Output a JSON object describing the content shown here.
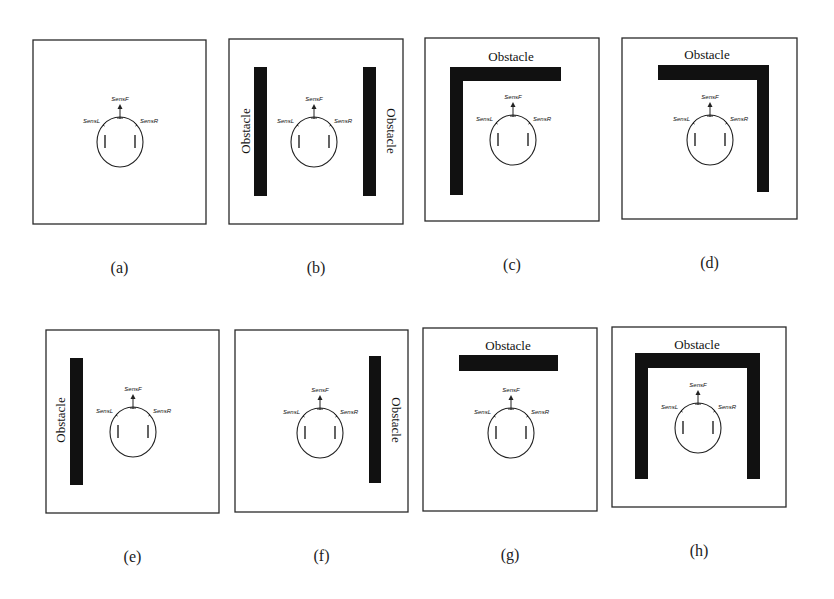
{
  "figure": {
    "obstacle_label": "Obstacle",
    "sensors": {
      "left": "SensL",
      "front": "SensF",
      "right": "SensR"
    },
    "colors": {
      "obstacle": "#111111",
      "line": "#222222",
      "background": "#ffffff"
    },
    "panels": [
      {
        "id": "a",
        "caption": "(a)",
        "description": "No obstacle",
        "box": [
          33,
          40,
          173,
          184
        ],
        "robot": [
          120,
          135
        ],
        "bars": [],
        "labels": []
      },
      {
        "id": "b",
        "caption": "(b)",
        "description": "Obstacles left and right",
        "box": [
          229,
          39,
          174,
          185
        ],
        "robot": [
          314,
          135
        ],
        "bars": [
          [
            254,
            67,
            13,
            129
          ],
          [
            363,
            67,
            13,
            129
          ]
        ],
        "labels": [
          {
            "x": 247,
            "y": 131,
            "rot": -90
          },
          {
            "x": 390,
            "y": 131,
            "rot": 90
          }
        ]
      },
      {
        "id": "c",
        "caption": "(c)",
        "description": "Obstacle front and left (corner)",
        "box": [
          425,
          38,
          174,
          183
        ],
        "robot": [
          513,
          133
        ],
        "bars": [
          [
            450,
            67,
            111,
            14
          ],
          [
            450,
            67,
            13,
            128
          ]
        ],
        "labels": [
          {
            "x": 511,
            "y": 58,
            "rot": 0
          }
        ]
      },
      {
        "id": "d",
        "caption": "(d)",
        "description": "Obstacle front and right (corner)",
        "box": [
          622,
          38,
          175,
          181
        ],
        "robot": [
          710,
          133
        ],
        "bars": [
          [
            658,
            65,
            111,
            15
          ],
          [
            757,
            65,
            12,
            127
          ]
        ],
        "labels": [
          {
            "x": 707,
            "y": 56,
            "rot": 0
          }
        ]
      },
      {
        "id": "e",
        "caption": "(e)",
        "description": "Obstacle left",
        "box": [
          46,
          330,
          173,
          183
        ],
        "robot": [
          133,
          425
        ],
        "bars": [
          [
            70,
            358,
            13,
            127
          ]
        ],
        "labels": [
          {
            "x": 62,
            "y": 420,
            "rot": -90
          }
        ]
      },
      {
        "id": "f",
        "caption": "(f)",
        "description": "Obstacle right",
        "box": [
          235,
          330,
          173,
          182
        ],
        "robot": [
          320,
          426
        ],
        "bars": [
          [
            369,
            356,
            12,
            127
          ]
        ],
        "labels": [
          {
            "x": 395,
            "y": 420,
            "rot": 90
          }
        ]
      },
      {
        "id": "g",
        "caption": "(g)",
        "description": "Obstacle front",
        "box": [
          423,
          328,
          174,
          183
        ],
        "robot": [
          511,
          426
        ],
        "bars": [
          [
            459,
            355,
            99,
            16
          ]
        ],
        "labels": [
          {
            "x": 508,
            "y": 347,
            "rot": 0
          }
        ]
      },
      {
        "id": "h",
        "caption": "(h)",
        "description": "Obstacles front, left and right (dead end)",
        "box": [
          612,
          327,
          174,
          180
        ],
        "robot": [
          698,
          421
        ],
        "bars": [
          [
            635,
            353,
            125,
            15
          ],
          [
            635,
            353,
            13,
            126
          ],
          [
            747,
            353,
            13,
            126
          ]
        ],
        "labels": [
          {
            "x": 697,
            "y": 346,
            "rot": 0
          }
        ]
      }
    ]
  }
}
